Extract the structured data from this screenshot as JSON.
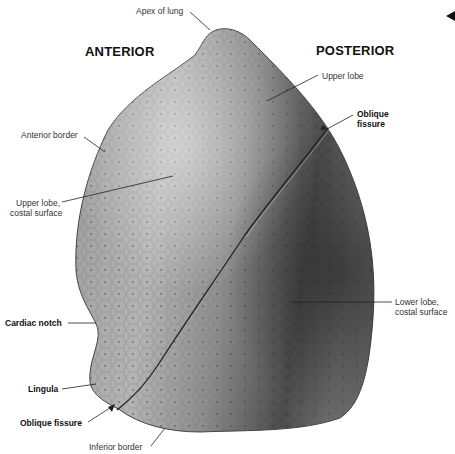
{
  "figure": {
    "orientation": {
      "left_heading": "ANTERIOR",
      "right_heading": "POSTERIOR"
    },
    "labels": {
      "apex": "Apex of lung",
      "upper_lobe": "Upper lobe",
      "oblique_fissure_top": [
        "Oblique",
        "fissure"
      ],
      "anterior_border": "Anterior border",
      "upper_lobe_costal": [
        "Upper lobe,",
        "costal surface"
      ],
      "lower_lobe_costal": [
        "Lower lobe,",
        "costal surface"
      ],
      "cardiac_notch": "Cardiac notch",
      "lingula": "Lingula",
      "oblique_fissure_bottom": "Oblique fissure",
      "inferior_border": "Inferior border"
    },
    "colors": {
      "lung_light": "#b8b8b8",
      "lung_mid": "#8a8a8a",
      "lung_dark": "#3a3a3a",
      "leader_line": "#222222",
      "text": "#333333"
    }
  },
  "nav": {
    "arrow": "left-arrow-icon"
  }
}
